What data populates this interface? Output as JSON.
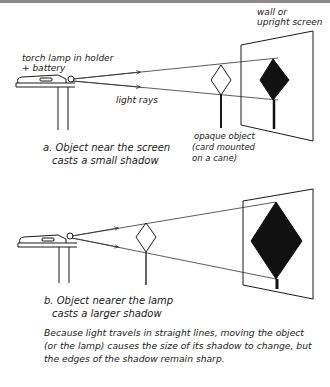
{
  "figure": {
    "diagram_a": {
      "label_lamp": [
        "torch lamp in holder",
        "+ battery"
      ],
      "label_rays": "light rays",
      "label_screen": [
        "wall or",
        "upright screen"
      ],
      "label_object": [
        "opaque object",
        "(card mounted",
        "on a cane)"
      ],
      "caption": [
        "a. Object near the screen",
        "casts a small shadow"
      ]
    },
    "diagram_b": {
      "caption": [
        "b. Object nearer the lamp",
        "casts a larger shadow"
      ]
    },
    "explanation": [
      "Because light travels in straight lines, moving the object",
      "(or the lamp) causes the size of its shadow to change, but",
      "the edges of the shadow remain sharp."
    ],
    "colors": {
      "ink": "#1a1a1a",
      "background": "#ffffff",
      "top_border": "#8a8a8a"
    }
  }
}
